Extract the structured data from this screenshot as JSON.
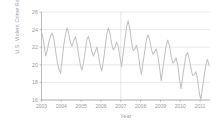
{
  "chart_data": {
    "type": "line",
    "title": "",
    "xlabel": "Year",
    "ylabel": "U.S. Violent Crime Rate",
    "ylim": [
      16,
      26
    ],
    "yticks": [
      16,
      18,
      20,
      22,
      24,
      26
    ],
    "xlim": [
      2003,
      2011.5
    ],
    "xticks": [
      2003,
      2004,
      2005,
      2006,
      2007,
      2008,
      2009,
      2010,
      2011
    ],
    "xtick_labels": [
      "2003",
      "2004",
      "2005",
      "2006",
      "2007",
      "2008",
      "2009",
      "2010",
      "2011"
    ],
    "grid": "horizontal-and-one-vertical",
    "legend": "none",
    "line_color": "#c2c2c2",
    "grid_color": "#cfcfcf",
    "axis_color": "#9d9d9d",
    "text_color": "#9a9a9a",
    "background": "#ffffff",
    "series": [
      {
        "name": "U.S. Violent Crime Rate",
        "x": [
          2003.04,
          2003.12,
          2003.21,
          2003.29,
          2003.37,
          2003.46,
          2003.54,
          2003.62,
          2003.71,
          2003.79,
          2003.87,
          2003.96,
          2004.04,
          2004.12,
          2004.21,
          2004.29,
          2004.37,
          2004.46,
          2004.54,
          2004.62,
          2004.71,
          2004.79,
          2004.87,
          2004.96,
          2005.04,
          2005.12,
          2005.21,
          2005.29,
          2005.37,
          2005.46,
          2005.54,
          2005.62,
          2005.71,
          2005.79,
          2005.87,
          2005.96,
          2006.04,
          2006.12,
          2006.21,
          2006.29,
          2006.37,
          2006.46,
          2006.54,
          2006.62,
          2006.71,
          2006.79,
          2006.87,
          2006.96,
          2007.04,
          2007.12,
          2007.21,
          2007.29,
          2007.37,
          2007.46,
          2007.54,
          2007.62,
          2007.71,
          2007.79,
          2007.87,
          2007.96,
          2008.04,
          2008.12,
          2008.21,
          2008.29,
          2008.37,
          2008.46,
          2008.54,
          2008.62,
          2008.71,
          2008.79,
          2008.87,
          2008.96,
          2009.04,
          2009.12,
          2009.21,
          2009.29,
          2009.37,
          2009.46,
          2009.54,
          2009.62,
          2009.71,
          2009.79,
          2009.87,
          2009.96,
          2010.04,
          2010.12,
          2010.21,
          2010.29,
          2010.37,
          2010.46,
          2010.54,
          2010.62,
          2010.71,
          2010.79,
          2010.87,
          2010.96,
          2011.04,
          2011.12,
          2011.21
        ],
        "values": [
          23.5,
          22.4,
          21.0,
          21.6,
          22.6,
          23.3,
          23.6,
          23.0,
          21.6,
          20.4,
          19.6,
          19.0,
          20.6,
          22.2,
          23.4,
          24.2,
          23.6,
          22.5,
          22.1,
          22.7,
          23.2,
          22.4,
          21.2,
          20.0,
          19.4,
          20.2,
          21.6,
          22.9,
          23.2,
          22.4,
          21.5,
          21.0,
          21.5,
          22.0,
          21.2,
          19.9,
          19.3,
          20.4,
          22.0,
          23.4,
          24.2,
          23.5,
          22.4,
          21.7,
          22.0,
          22.6,
          22.1,
          20.8,
          19.8,
          21.3,
          22.9,
          24.3,
          25.0,
          24.0,
          22.6,
          21.6,
          21.8,
          22.2,
          21.4,
          19.9,
          18.9,
          20.2,
          21.6,
          22.8,
          23.4,
          22.8,
          21.8,
          21.2,
          21.5,
          21.8,
          21.0,
          19.6,
          18.2,
          19.5,
          21.0,
          22.2,
          22.8,
          22.1,
          21.0,
          20.2,
          20.4,
          20.8,
          20.0,
          18.4,
          17.3,
          18.6,
          20.0,
          21.1,
          21.4,
          20.6,
          19.6,
          18.8,
          18.9,
          19.2,
          18.4,
          16.8,
          16.0,
          17.4,
          18.8
        ]
      },
      {
        "name": "U.S. Violent Crime Rate (tail)",
        "x": [
          2011.21,
          2011.29,
          2011.37,
          2011.46
        ],
        "values": [
          18.8,
          20.0,
          20.6,
          19.9
        ]
      }
    ]
  }
}
